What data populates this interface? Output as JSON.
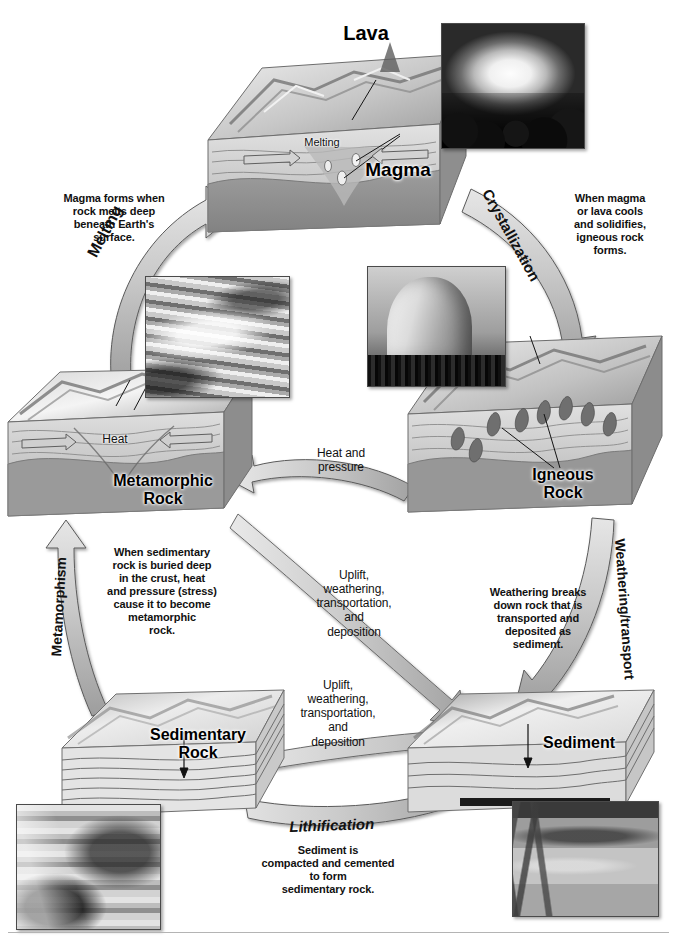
{
  "diagram": {
    "stage_labels": {
      "lava": "Lava",
      "magma": "Magma",
      "melting_inset": "Melting",
      "metamorphic_rock": "Metamorphic\nRock",
      "metamorphic_rock_line1": "Metamorphic",
      "metamorphic_rock_line2": "Rock",
      "heat": "Heat",
      "igneous_rock_line1": "Igneous",
      "igneous_rock_line2": "Rock",
      "sedimentary_rock_line1": "Sedimentary",
      "sedimentary_rock_line2": "Rock",
      "sediment": "Sediment"
    },
    "process_labels": {
      "melting": "Melting",
      "crystallization": "Crystallization",
      "weathering_transport": "Weathering/transport",
      "metamorphism": "Metamorphism",
      "lithification": "Lithification",
      "heat_and_pressure": "Heat and\npressure",
      "heat_and_pressure_line1": "Heat and",
      "heat_and_pressure_line2": "pressure",
      "uplift_upper": "Uplift,\nweathering,\ntransportation,\nand\ndeposition",
      "uplift_lower": "Uplift,\nweathering,\ntransportation,\nand\ndeposition"
    },
    "descriptions": {
      "magma_forms": "Magma forms when\nrock melts deep\nbeneath Earth's\nsurface.",
      "when_magma_cools": "When magma\nor lava cools\nand solidifies,\nigneous rock\nforms.",
      "when_sedimentary_buried": "When sedimentary\nrock is buried deep\nin the crust, heat\nand pressure (stress)\ncause it to become\nmetamorphic\nrock.",
      "weathering_breaks": "Weathering breaks\ndown rock that is\ntransported and\ndeposited as\nsediment.",
      "sediment_compacted": "Sediment is\ncompacted and cemented\nto form\nsedimentary rock."
    },
    "uplift_text_lines": [
      "Uplift,",
      "weathering,",
      "transportation,",
      "and",
      "deposition"
    ],
    "photos": [
      {
        "name": "lava-eruption-photo",
        "caption": "Erupting lava fountain"
      },
      {
        "name": "folded-metamorphic-rock-photo",
        "caption": "Folded metamorphic rock outcrop"
      },
      {
        "name": "granite-dome-photo",
        "caption": "Granite dome, igneous rock"
      },
      {
        "name": "canyon-strata-photo",
        "caption": "Layered canyon sedimentary rock"
      },
      {
        "name": "braided-river-photo",
        "caption": "Braided river depositing sediment"
      }
    ],
    "colors": {
      "arrow_fill": "#c8c8c8",
      "arrow_stroke": "#555555",
      "block_top": "#d9d9d9",
      "block_side": "#9a9a9a",
      "text": "#111111",
      "background": "#ffffff"
    }
  }
}
